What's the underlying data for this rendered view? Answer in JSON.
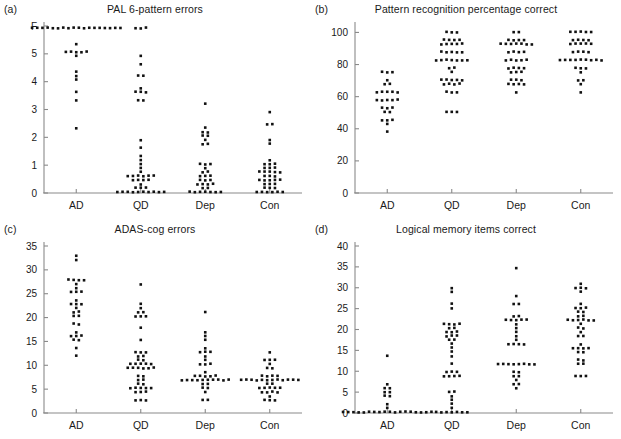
{
  "figure": {
    "background": "#ffffff",
    "dot_color": "#111111",
    "axis_color": "#8a8a8a",
    "groups": [
      "AD",
      "QD",
      "Dep",
      "Con"
    ]
  },
  "panels": [
    {
      "letter": "(a)",
      "title": "PAL 6-pattern errors"
    },
    {
      "letter": "(b)",
      "title": "Pattern recognition percentage correct"
    },
    {
      "letter": "(c)",
      "title": "ADAS-cog errors"
    },
    {
      "letter": "(d)",
      "title": "Logical memory items correct"
    }
  ],
  "chart_data": [
    {
      "type": "scatter",
      "panel": "(a)",
      "title": "PAL 6-pattern errors",
      "xlabel": "",
      "ylabel": "",
      "categories": [
        "AD",
        "QD",
        "Dep",
        "Con"
      ],
      "ytick_labels": [
        "0",
        "1",
        "2",
        "3",
        "4",
        "5",
        "F"
      ],
      "ytick_values": [
        0,
        1,
        2,
        3,
        4,
        5,
        6
      ],
      "ylim": [
        0,
        6
      ],
      "grid": false,
      "legend": "none",
      "note": "F denotes failure to complete the 6-pattern stage; plotted above 5.",
      "series": [
        {
          "name": "AD",
          "values": [
            6,
            6,
            6,
            6,
            6,
            6,
            6,
            6,
            6,
            6,
            6,
            6,
            6,
            6,
            6,
            6,
            6,
            6,
            5.3,
            5.1,
            5.05,
            5.0,
            5.0,
            5.0,
            4.9,
            4.4,
            4.25,
            4.1,
            3.6,
            3.4,
            2.35
          ]
        },
        {
          "name": "QD",
          "values": [
            6,
            6,
            6,
            4.95,
            4.65,
            4.25,
            4.2,
            3.75,
            3.7,
            3.7,
            3.65,
            3.3,
            3.3,
            1.85,
            1.6,
            1.35,
            1.2,
            1.05,
            0.95,
            0.8,
            0.65,
            0.6,
            0.6,
            0.6,
            0.55,
            0.55,
            0.5,
            0.5,
            0.5,
            0.45,
            0.3,
            0.25,
            0.25,
            0.2,
            0.1,
            0.05,
            0.05,
            0.0,
            0.0,
            0.0,
            0.0,
            0.0,
            0.0,
            0.0
          ]
        },
        {
          "name": "Dep",
          "values": [
            3.15,
            2.4,
            2.2,
            2.15,
            2.1,
            2.05,
            1.85,
            1.75,
            1.7,
            1.05,
            1.0,
            1.0,
            0.95,
            0.75,
            0.7,
            0.65,
            0.6,
            0.55,
            0.5,
            0.5,
            0.4,
            0.35,
            0.35,
            0.3,
            0.3,
            0.25,
            0.15,
            0.1,
            0.05,
            0.0,
            0.0,
            0.0,
            0.0,
            0.0
          ]
        },
        {
          "name": "Con",
          "values": [
            2.85,
            2.55,
            2.45,
            1.9,
            1.75,
            1.2,
            1.1,
            1.05,
            1.0,
            0.95,
            0.9,
            0.85,
            0.8,
            0.75,
            0.75,
            0.7,
            0.7,
            0.65,
            0.6,
            0.55,
            0.5,
            0.45,
            0.45,
            0.4,
            0.4,
            0.35,
            0.3,
            0.3,
            0.25,
            0.2,
            0.15,
            0.1,
            0.05,
            0.0,
            0.0,
            0.0,
            0.0
          ]
        }
      ]
    },
    {
      "type": "scatter",
      "panel": "(b)",
      "title": "Pattern recognition percentage correct",
      "xlabel": "",
      "ylabel": "",
      "categories": [
        "AD",
        "QD",
        "Dep",
        "Con"
      ],
      "ytick_labels": [
        "0",
        "20",
        "40",
        "60",
        "80",
        "100"
      ],
      "ytick_values": [
        0,
        20,
        40,
        60,
        80,
        100
      ],
      "ylim": [
        0,
        104
      ],
      "grid": false,
      "legend": "none",
      "series": [
        {
          "name": "AD",
          "values": [
            76,
            76,
            76,
            71,
            67,
            67,
            62.5,
            62.5,
            62.5,
            62.5,
            62.5,
            58.5,
            58.5,
            58.5,
            58.5,
            58.5,
            54,
            54,
            54,
            50,
            50,
            46,
            46,
            46,
            42,
            38
          ]
        },
        {
          "name": "QD",
          "values": [
            100,
            100,
            100,
            96,
            96,
            96,
            96,
            92,
            92,
            92,
            92,
            92,
            88,
            88,
            88,
            88,
            88,
            84,
            84,
            84,
            84,
            84,
            84,
            84,
            79,
            79,
            75,
            71,
            71,
            71,
            71,
            71,
            67,
            67,
            67,
            67,
            62.5,
            62.5,
            62.5,
            50,
            50,
            50
          ]
        },
        {
          "name": "Dep",
          "values": [
            100,
            100,
            96,
            96,
            96,
            96,
            92,
            92,
            92,
            92,
            92,
            92,
            92,
            88,
            88,
            88,
            88,
            84,
            84,
            84,
            84,
            84,
            79,
            79,
            79,
            79,
            75,
            75,
            75,
            71,
            71,
            71,
            67,
            67,
            67,
            67,
            62.5
          ]
        },
        {
          "name": "Con",
          "values": [
            100,
            100,
            100,
            100,
            100,
            96,
            96,
            96,
            96,
            92,
            92,
            92,
            92,
            92,
            88,
            88,
            88,
            88,
            84,
            84,
            84,
            84,
            84,
            84,
            84,
            84,
            84,
            79,
            79,
            79,
            75,
            71,
            71,
            67,
            62.5
          ]
        }
      ]
    },
    {
      "type": "scatter",
      "panel": "(c)",
      "title": "ADAS-cog errors",
      "xlabel": "",
      "ylabel": "",
      "categories": [
        "AD",
        "QD",
        "Dep",
        "Con"
      ],
      "ytick_labels": [
        "0",
        "5",
        "10",
        "15",
        "20",
        "25",
        "30",
        "35"
      ],
      "ytick_values": [
        0,
        5,
        10,
        15,
        20,
        25,
        30,
        35
      ],
      "ylim": [
        0,
        35
      ],
      "grid": false,
      "legend": "none",
      "series": [
        {
          "name": "AD",
          "values": [
            33,
            32,
            28,
            28,
            28,
            28,
            27,
            26,
            25,
            25,
            25,
            24,
            23,
            23,
            23,
            22,
            21,
            21,
            20,
            20,
            19,
            19,
            17,
            16,
            16,
            16,
            15,
            15,
            14,
            12
          ]
        },
        {
          "name": "QD",
          "values": [
            27,
            23,
            22,
            21,
            21,
            20,
            20,
            20,
            18,
            15,
            13,
            13,
            13,
            12,
            12,
            11,
            11,
            10,
            10,
            10,
            10,
            10,
            9.5,
            9.5,
            9.5,
            9.5,
            9.5,
            9.5,
            8,
            8,
            7,
            7,
            6,
            6,
            5,
            5,
            5,
            5,
            5,
            4.5,
            4,
            4,
            3,
            3,
            2.5
          ]
        },
        {
          "name": "Dep",
          "values": [
            21,
            17,
            16,
            15,
            14,
            13,
            13,
            13,
            12,
            11,
            10,
            10,
            10,
            9,
            8,
            8,
            8,
            8,
            7.5,
            7.2,
            7.2,
            7.2,
            7.2,
            7.2,
            7.2,
            7.2,
            7,
            7,
            6.5,
            6,
            6,
            5,
            5,
            4.5,
            3,
            3
          ]
        },
        {
          "name": "Con",
          "values": [
            13,
            11,
            11,
            11,
            10,
            9.5,
            9.5,
            8,
            8,
            8,
            8,
            7.2,
            7.2,
            7.2,
            7.2,
            7.2,
            7.2,
            7.2,
            7.2,
            7.2,
            6.5,
            6.5,
            6.5,
            6,
            6,
            5.5,
            5.5,
            5,
            5,
            5,
            4.5,
            4.5,
            4,
            4,
            3.5,
            3,
            3,
            3
          ]
        }
      ]
    },
    {
      "type": "scatter",
      "panel": "(d)",
      "title": "Logical memory items correct",
      "xlabel": "",
      "ylabel": "",
      "categories": [
        "AD",
        "QD",
        "Dep",
        "Con"
      ],
      "ytick_labels": [
        "0",
        "5",
        "10",
        "15",
        "20",
        "25",
        "30",
        "35",
        "40"
      ],
      "ytick_values": [
        0,
        5,
        10,
        15,
        20,
        25,
        30,
        35,
        40
      ],
      "ylim": [
        0,
        40
      ],
      "grid": false,
      "legend": "none",
      "series": [
        {
          "name": "AD",
          "values": [
            14,
            7,
            6,
            6,
            5.5,
            5,
            4.5,
            4,
            2,
            1.5,
            0,
            0,
            0,
            0,
            0,
            0,
            0,
            0,
            0,
            0,
            0,
            0,
            0,
            0,
            0,
            0,
            0,
            0
          ]
        },
        {
          "name": "QD",
          "values": [
            30,
            29,
            26,
            25,
            21,
            21,
            21,
            21,
            20,
            20,
            19,
            19,
            19,
            18,
            18,
            18,
            17.5,
            17.5,
            17,
            16,
            15,
            14,
            12,
            10,
            10,
            10,
            9,
            8.5,
            8.5,
            8.5,
            5.5,
            5,
            4,
            3.5,
            2,
            1,
            0,
            0,
            0,
            0,
            0,
            0,
            0
          ]
        },
        {
          "name": "Dep",
          "values": [
            35,
            28,
            26,
            26,
            23,
            23,
            22,
            22,
            22,
            22,
            22,
            21.5,
            20,
            19,
            18,
            17.5,
            17,
            16.5,
            16.5,
            16.5,
            12,
            12,
            11.5,
            11.5,
            11.5,
            11.5,
            11.5,
            11.5,
            10,
            9.5,
            9,
            8.5,
            7.5,
            7,
            6.5,
            6
          ]
        },
        {
          "name": "Con",
          "values": [
            31,
            30,
            30,
            30,
            29,
            26,
            25.5,
            25,
            25,
            24.5,
            24,
            23.5,
            23,
            22.5,
            22,
            22,
            22,
            22,
            22,
            21.5,
            20.5,
            20,
            19,
            18.5,
            18,
            17,
            16,
            15.5,
            15.5,
            15.5,
            15,
            15,
            13,
            12.5,
            11.5,
            11.5,
            8.5,
            8.5,
            8.5
          ]
        }
      ]
    }
  ]
}
